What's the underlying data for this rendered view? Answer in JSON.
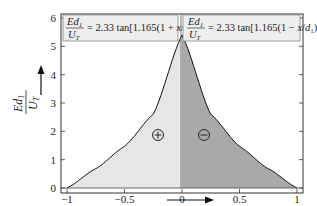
{
  "chart_data": {
    "type": "area",
    "title": "",
    "xlabel": "x/d1",
    "ylabel": "E d1 / U_T",
    "xlim": [
      -1,
      1
    ],
    "ylim": [
      0,
      6
    ],
    "x_ticks": [
      "-1",
      "-0.5",
      "0",
      "0.5",
      "1"
    ],
    "y_ticks": [
      "0",
      "1",
      "2",
      "3",
      "4",
      "5",
      "6"
    ],
    "grid": false,
    "series": [
      {
        "name": "left",
        "formula": "Ed1/UT = 2.33 tan[1.165(1 + x/d1)]",
        "region_sign": "+",
        "fill": "#e6e6e6",
        "x": [
          -1.0,
          -0.75,
          -0.5,
          -0.25,
          0.0
        ],
        "y": [
          0.0,
          0.68,
          1.47,
          2.6,
          5.4
        ]
      },
      {
        "name": "right",
        "formula": "Ed1/UT = 2.33 tan[1.165(1 - x/d1)]",
        "region_sign": "-",
        "fill": "#a9a9a9",
        "x": [
          0.0,
          0.25,
          0.5,
          0.75,
          1.0
        ],
        "y": [
          5.4,
          2.6,
          1.47,
          0.68,
          0.0
        ]
      }
    ],
    "legend": {
      "left": {
        "lhs_num": "Ed",
        "lhs_num_sub": "1",
        "lhs_den": "U",
        "lhs_den_sub": "T",
        "rhs": "= 2.33 tan[1.165(1 + x/d",
        "rhs_sub": "1",
        "rhs_end": ")]"
      },
      "right": {
        "lhs_num": "Ed",
        "lhs_num_sub": "1",
        "lhs_den": "U",
        "lhs_den_sub": "T",
        "rhs": "= 2.33 tan[1.165(1 − x/d",
        "rhs_sub": "1",
        "rhs_end": ")]"
      }
    },
    "annotations": [
      "⊕",
      "⊖"
    ],
    "legend_position": "top"
  }
}
